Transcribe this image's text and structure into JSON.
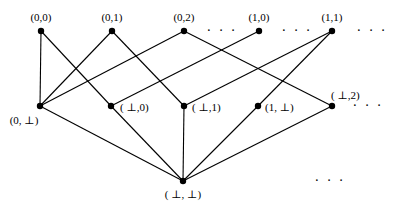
{
  "diagram": {
    "type": "hasse-diagram",
    "nodes": [
      {
        "id": "n00",
        "label": "(0,0)",
        "x": 41,
        "y": 31,
        "lx": 41,
        "ly": 21,
        "anchor": "middle"
      },
      {
        "id": "n01",
        "label": "(0,1)",
        "x": 112,
        "y": 31,
        "lx": 112,
        "ly": 21,
        "anchor": "middle"
      },
      {
        "id": "n02",
        "label": "(0,2)",
        "x": 184,
        "y": 31,
        "lx": 184,
        "ly": 21,
        "anchor": "middle"
      },
      {
        "id": "n10",
        "label": "(1,0)",
        "x": 259,
        "y": 31,
        "lx": 259,
        "ly": 21,
        "anchor": "middle"
      },
      {
        "id": "n11",
        "label": "(1,1)",
        "x": 332,
        "y": 31,
        "lx": 332,
        "ly": 21,
        "anchor": "middle"
      },
      {
        "id": "n0b",
        "label": "(0, ⊥)",
        "x": 40,
        "y": 106,
        "lx": 24,
        "ly": 124,
        "anchor": "middle"
      },
      {
        "id": "nb0",
        "label": "( ⊥,0)",
        "x": 111,
        "y": 106,
        "lx": 120,
        "ly": 111,
        "anchor": "start"
      },
      {
        "id": "nb1",
        "label": "( ⊥,1)",
        "x": 184,
        "y": 106,
        "lx": 192,
        "ly": 111,
        "anchor": "start"
      },
      {
        "id": "n1b",
        "label": "(1, ⊥)",
        "x": 258,
        "y": 106,
        "lx": 265,
        "ly": 111,
        "anchor": "start"
      },
      {
        "id": "nb2",
        "label": "( ⊥,2)",
        "x": 332,
        "y": 106,
        "lx": 331,
        "ly": 99,
        "anchor": "start"
      },
      {
        "id": "nbb",
        "label": "( ⊥, ⊥)",
        "x": 183,
        "y": 181,
        "lx": 183,
        "ly": 198,
        "anchor": "middle"
      }
    ],
    "edges": [
      [
        "n00",
        "n0b"
      ],
      [
        "n00",
        "nb0"
      ],
      [
        "n01",
        "n0b"
      ],
      [
        "n01",
        "nb1"
      ],
      [
        "n02",
        "n0b"
      ],
      [
        "n02",
        "nb2"
      ],
      [
        "n10",
        "nb0"
      ],
      [
        "n11",
        "nb1"
      ],
      [
        "n11",
        "n1b"
      ],
      [
        "n0b",
        "nbb"
      ],
      [
        "nb0",
        "nbb"
      ],
      [
        "nb1",
        "nbb"
      ],
      [
        "n1b",
        "nbb"
      ],
      [
        "nb2",
        "nbb"
      ]
    ],
    "ellipses": [
      {
        "id": "top-dots-1",
        "text": "· · ·",
        "x": 222,
        "y": 35
      },
      {
        "id": "top-dots-2",
        "text": "· · ·",
        "x": 297,
        "y": 35
      },
      {
        "id": "top-dots-3",
        "text": "· · ·",
        "x": 372,
        "y": 35
      },
      {
        "id": "mid-dots",
        "text": "· · ·",
        "x": 368,
        "y": 110
      },
      {
        "id": "bottom-dots",
        "text": "· · ·",
        "x": 330,
        "y": 185
      }
    ]
  }
}
